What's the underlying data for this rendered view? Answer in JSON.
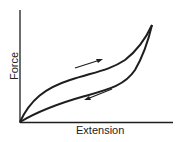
{
  "diagram": {
    "type": "hysteresis-loop",
    "xlabel": "Extension",
    "ylabel": "Force",
    "curves": [
      {
        "name": "loading",
        "direction": "increasing extension",
        "arrow": "up-right"
      },
      {
        "name": "unloading",
        "direction": "decreasing extension",
        "arrow": "down-left"
      }
    ],
    "colors": {
      "line": "#1e1e1e",
      "background": "#ffffff"
    }
  }
}
